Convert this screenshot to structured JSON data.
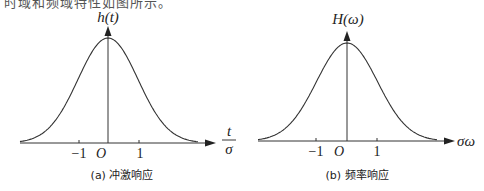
{
  "top_text": "时域和频域特性如图所示。",
  "panels": [
    {
      "y_label": "h(t)",
      "x_label_num": "t",
      "x_label_den": "σ",
      "tick_neg": "−1",
      "origin": "O",
      "tick_pos": "1",
      "caption": "(a) 冲激响应"
    },
    {
      "y_label": "H(ω)",
      "x_label": "σω",
      "tick_neg": "−1",
      "origin": "O",
      "tick_pos": "1",
      "caption": "(b) 频率响应"
    }
  ],
  "colors": {
    "line": "#333333",
    "background": "#ffffff"
  },
  "chart_data": [
    {
      "type": "line",
      "title": "(a) 冲激响应",
      "xlabel": "t/σ",
      "ylabel": "h(t)",
      "x_ticks": [
        "-1",
        "O",
        "1"
      ],
      "series": [
        {
          "name": "h(t) Gaussian",
          "x": [
            -3,
            -2.5,
            -2,
            -1.5,
            -1,
            -0.5,
            0,
            0.5,
            1,
            1.5,
            2,
            2.5,
            3
          ],
          "values": [
            0.011,
            0.044,
            0.135,
            0.325,
            0.607,
            0.882,
            1.0,
            0.882,
            0.607,
            0.325,
            0.135,
            0.044,
            0.011
          ]
        }
      ],
      "xlim": [
        -3,
        3.5
      ],
      "grid": false,
      "legend": "none"
    },
    {
      "type": "line",
      "title": "(b) 频率响应",
      "xlabel": "σω",
      "ylabel": "H(ω)",
      "x_ticks": [
        "-1",
        "O",
        "1"
      ],
      "series": [
        {
          "name": "H(ω) Gaussian",
          "x": [
            -3,
            -2.5,
            -2,
            -1.5,
            -1,
            -0.5,
            0,
            0.5,
            1,
            1.5,
            2,
            2.5,
            3
          ],
          "values": [
            0.011,
            0.044,
            0.135,
            0.325,
            0.607,
            0.882,
            1.0,
            0.882,
            0.607,
            0.325,
            0.135,
            0.044,
            0.011
          ]
        }
      ],
      "xlim": [
        -3,
        3.5
      ],
      "grid": false,
      "legend": "none"
    }
  ]
}
